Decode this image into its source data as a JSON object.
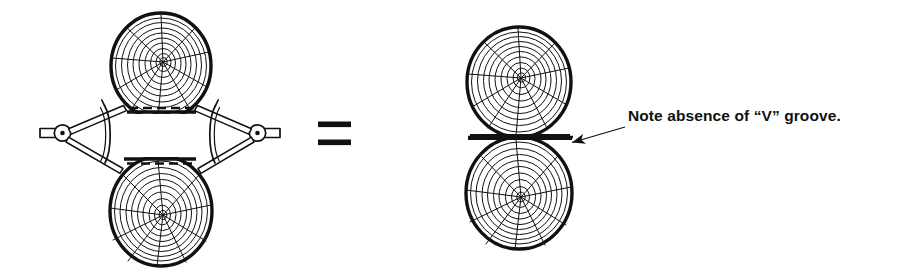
{
  "figure": {
    "background_color": "#ffffff",
    "ink_color": "#111111",
    "equals_symbol": "=",
    "annotation": {
      "text": "Note absence of “V” groove.",
      "leader_from": [
        625,
        128
      ],
      "leader_to": [
        578,
        143
      ],
      "arrow_tip": [
        556,
        140
      ]
    },
    "left_assembly": {
      "label": "logs-held-apart-by-clamp",
      "top_log": {
        "center": [
          161,
          66
        ],
        "radius_x": 50,
        "radius_y": 53,
        "flat_face": "bottom",
        "cut_line_style": "dashed"
      },
      "bottom_log": {
        "center": [
          161,
          211
        ],
        "radius_x": 51,
        "radius_y": 55,
        "flat_face": "top",
        "cut_line_style": "dashed"
      },
      "clamp": {
        "left_pivot": [
          62,
          133
        ],
        "right_pivot": [
          258,
          133
        ],
        "handle_left_end": [
          40,
          133
        ],
        "handle_right_end": [
          280,
          133
        ]
      }
    },
    "right_assembly": {
      "label": "logs-mated-flat",
      "top_log": {
        "center": [
          519,
          82
        ],
        "radius_x": 52,
        "radius_y": 55,
        "flat_face": "bottom"
      },
      "bottom_log": {
        "center": [
          519,
          193
        ],
        "radius_x": 53,
        "radius_y": 56,
        "flat_face": "top"
      },
      "joint_line_y": 137,
      "joint_x_range": [
        468,
        572
      ]
    },
    "rings": {
      "count_per_log": 9,
      "radial_crack_count": 10,
      "ring_stroke_width": 1.0,
      "bark_stroke_width": 3.2
    }
  }
}
